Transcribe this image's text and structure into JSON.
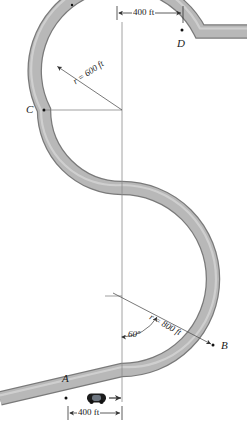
{
  "figure": {
    "road_fill": "#b5b5b5",
    "road_edge": "#7a7a7a",
    "line_color": "#555555",
    "text_color": "#1a1a1a",
    "car_color": "#1c1c1c"
  },
  "points": [
    {
      "id": "A",
      "label": "A",
      "x": 66,
      "y": 398,
      "label_x": 62,
      "label_y": 378
    },
    {
      "id": "B",
      "label": "B",
      "x": 213,
      "y": 345,
      "label_x": 221,
      "label_y": 346
    },
    {
      "id": "C",
      "label": "C",
      "x": 44,
      "y": 110,
      "label_x": 26,
      "label_y": 104
    },
    {
      "id": "D",
      "label": "D",
      "x": 182,
      "y": 30,
      "label_x": 177,
      "label_y": 38
    }
  ],
  "dimensions": [
    {
      "id": "top-400",
      "text": "400 ft",
      "x1": 117,
      "y": 13,
      "x2": 183,
      "text_x": 132,
      "text_y": 8
    },
    {
      "id": "bottom-400",
      "text": "400 ft",
      "x1": 68,
      "y": 413,
      "x2": 122,
      "text_x": 77,
      "text_y": 408
    }
  ],
  "radii": [
    {
      "id": "upper",
      "text": "r = 600 ft",
      "center_x": 122,
      "center_y": 110,
      "value": 600,
      "pixel_radius": 78,
      "text_x": 74,
      "text_y": 78,
      "angle_deg": -34
    },
    {
      "id": "lower",
      "text": "r = 800 ft",
      "center_x": 122,
      "center_y": 296,
      "value": 800,
      "pixel_radius": 91,
      "text_x": 150,
      "text_y": 312,
      "angle_deg": 29
    }
  ],
  "angles": [
    {
      "id": "lower-60",
      "text": "60°",
      "value": 60,
      "unit": "degrees",
      "vertex_x": 122,
      "vertex_y": 296,
      "text_x": 128,
      "text_y": 332
    }
  ],
  "car": {
    "label": "car",
    "x": 97,
    "y": 398,
    "direction": "right",
    "arrow_text": "→"
  },
  "centerline": {
    "x": 122,
    "y_top": 22,
    "y_bottom": 402
  }
}
